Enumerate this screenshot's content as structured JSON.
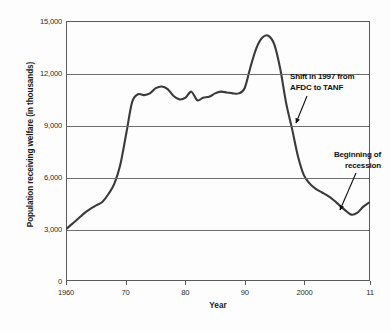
{
  "figure": {
    "background_color": "#fdfdfd",
    "line_color": "#3a3a3a",
    "grid_color": "#6e6e6e",
    "frame_color": "#5a5a5a",
    "text_color": "#1a1a1a"
  },
  "annotations": {
    "shift": {
      "line1": "Shift in 1997 from",
      "line2": "AFDC to TANF"
    },
    "recession": {
      "line1": "Beginning of",
      "line2": "recession"
    }
  },
  "bottom_caption": {
    "text": ""
  },
  "chart_data": {
    "type": "line",
    "title": "",
    "xlabel": "Year",
    "ylabel": "Population receiving welfare (in thousands)",
    "xlim": [
      1960,
      2011
    ],
    "ylim": [
      0,
      15000
    ],
    "grid": true,
    "legend": "none",
    "y_ticks": [
      0,
      3000,
      6000,
      9000,
      12000,
      15000
    ],
    "y_tick_labels": [
      "0",
      "3,000",
      "6,000",
      "9,000",
      "12,000",
      "15,000"
    ],
    "x_ticks": [
      1960,
      1970,
      1980,
      1990,
      2000,
      2011
    ],
    "x_tick_labels": [
      "1960",
      "70",
      "80",
      "90",
      "2000",
      "11"
    ],
    "series": [
      {
        "name": "Population receiving welfare",
        "x": [
          1960,
          1961,
          1962,
          1963,
          1964,
          1965,
          1966,
          1967,
          1968,
          1969,
          1970,
          1971,
          1972,
          1973,
          1974,
          1975,
          1976,
          1977,
          1978,
          1979,
          1980,
          1981,
          1982,
          1983,
          1984,
          1985,
          1986,
          1987,
          1988,
          1989,
          1990,
          1991,
          1992,
          1993,
          1994,
          1995,
          1996,
          1997,
          1998,
          1999,
          2000,
          2001,
          2002,
          2003,
          2004,
          2005,
          2006,
          2007,
          2008,
          2009,
          2010,
          2011
        ],
        "values": [
          3000,
          3300,
          3600,
          3900,
          4150,
          4350,
          4550,
          5000,
          5600,
          6700,
          8500,
          10350,
          10800,
          10750,
          10850,
          11150,
          11250,
          11100,
          10700,
          10500,
          10600,
          10950,
          10450,
          10600,
          10650,
          10850,
          10950,
          10900,
          10850,
          10850,
          11150,
          12400,
          13500,
          14100,
          14200,
          13700,
          12300,
          10300,
          8800,
          7200,
          6100,
          5600,
          5300,
          5100,
          4900,
          4650,
          4350,
          4050,
          3800,
          3900,
          4250,
          4500
        ],
        "peak": {
          "year": 1994,
          "value": 14200
        },
        "start": {
          "year": 1960,
          "value": 3000
        },
        "trough": {
          "year": 2008,
          "value": 3800
        },
        "end": {
          "year": 2011,
          "value": 4500
        }
      }
    ],
    "annotations": [
      {
        "label": "Shift in 1997 from AFDC to TANF",
        "target_year": 1997,
        "target_value": 8900
      },
      {
        "label": "Beginning of recession",
        "target_year": 2008,
        "target_value": 3900
      }
    ]
  }
}
